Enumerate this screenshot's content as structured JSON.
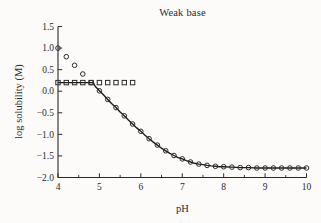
{
  "chart_data": {
    "type": "line+scatter",
    "title": "Weak base",
    "xlabel": "pH",
    "ylabel": "log solubility (M)",
    "xlim": [
      4,
      10
    ],
    "ylim": [
      -2.0,
      1.5
    ],
    "grid": false,
    "legend": null,
    "x_ticks": {
      "values": [
        4,
        5,
        6,
        7,
        8,
        9,
        10
      ],
      "labels": [
        "4",
        "5",
        "6",
        "7",
        "8",
        "9",
        "10"
      ]
    },
    "x_minor_ticks": [
      4.5,
      5.5,
      6.5,
      7.5,
      8.5,
      9.5
    ],
    "y_ticks": {
      "values": [
        1.5,
        1.0,
        0.5,
        0.0,
        -0.5,
        -1.0,
        -1.5,
        -2.0
      ],
      "labels": [
        "1.5",
        "1.0",
        "0.5",
        "0.0",
        "−0.5",
        "−1.0",
        "−1.5",
        "−2.0"
      ]
    },
    "series": [
      {
        "id": "line",
        "type": "line",
        "x": [
          4.0,
          4.85,
          4.9,
          5.0,
          5.1,
          5.2,
          5.3,
          5.4,
          5.5,
          5.6,
          5.7,
          5.8,
          5.9,
          6.0,
          6.1,
          6.2,
          6.3,
          6.4,
          6.5,
          6.6,
          6.7,
          6.8,
          6.9,
          7.0,
          7.1,
          7.2,
          7.3,
          7.4,
          7.5,
          7.6,
          7.7,
          7.8,
          7.9,
          8.0,
          8.2,
          8.4,
          8.6,
          8.8,
          9.0,
          9.2,
          9.4,
          9.6,
          9.8,
          10.0
        ],
        "y": [
          0.2,
          0.2,
          0.11,
          0.01,
          -0.09,
          -0.19,
          -0.29,
          -0.38,
          -0.48,
          -0.57,
          -0.67,
          -0.76,
          -0.85,
          -0.93,
          -1.02,
          -1.1,
          -1.18,
          -1.25,
          -1.32,
          -1.38,
          -1.44,
          -1.49,
          -1.54,
          -1.57,
          -1.61,
          -1.64,
          -1.67,
          -1.69,
          -1.7,
          -1.72,
          -1.73,
          -1.74,
          -1.75,
          -1.75,
          -1.76,
          -1.77,
          -1.77,
          -1.78,
          -1.78,
          -1.78,
          -1.78,
          -1.78,
          -1.78,
          -1.78
        ]
      },
      {
        "id": "circles",
        "type": "scatter",
        "marker": "circle",
        "x": [
          4.0,
          4.2,
          4.4,
          4.6,
          4.8,
          5.0,
          5.2,
          5.4,
          5.6,
          5.8,
          6.0,
          6.2,
          6.4,
          6.6,
          6.8,
          7.0,
          7.2,
          7.4,
          7.6,
          7.8,
          8.0,
          8.2,
          8.4,
          8.6,
          8.8,
          9.0,
          9.2,
          9.4,
          9.6,
          9.8,
          10.0
        ],
        "y": [
          1.0,
          0.8,
          0.6,
          0.4,
          0.2,
          0.01,
          -0.19,
          -0.38,
          -0.57,
          -0.76,
          -0.93,
          -1.1,
          -1.25,
          -1.38,
          -1.49,
          -1.57,
          -1.64,
          -1.69,
          -1.72,
          -1.74,
          -1.75,
          -1.76,
          -1.77,
          -1.77,
          -1.78,
          -1.78,
          -1.78,
          -1.78,
          -1.78,
          -1.78,
          -1.78
        ]
      },
      {
        "id": "squares",
        "type": "scatter",
        "marker": "square",
        "x": [
          4.0,
          4.2,
          4.4,
          4.6,
          4.8,
          5.0,
          5.2,
          5.4,
          5.6,
          5.8
        ],
        "y": [
          0.2,
          0.2,
          0.2,
          0.2,
          0.2,
          0.2,
          0.2,
          0.2,
          0.2,
          0.2
        ]
      }
    ]
  },
  "style": {
    "line_color": "#1c1c1c",
    "marker_color": "#2b2b2b",
    "axis_color": "#2a2a2a",
    "background": "#fcfbf9"
  }
}
